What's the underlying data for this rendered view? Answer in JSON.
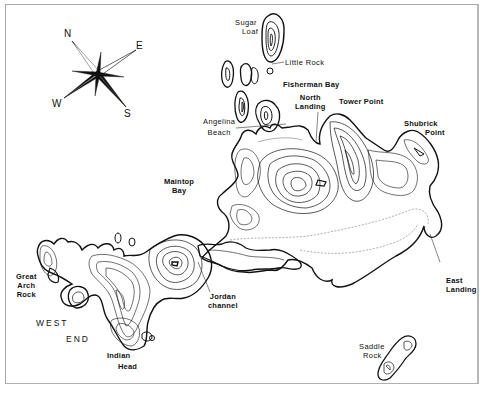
{
  "map": {
    "type": "island topographic contour map",
    "line_color": "#111111",
    "frame_color": "#a8a8a8",
    "compass": {
      "icon": "compass-rose-icon",
      "letters": {
        "north": "N",
        "east": "E",
        "south": "S",
        "west": "W"
      }
    },
    "labels": {
      "sugar_loaf": [
        "Sugar",
        "Loaf"
      ],
      "little_rock": "Little Rock",
      "fisherman_bay": "Fisherman Bay",
      "north_landing": [
        "North",
        "Landing"
      ],
      "tower_point": "Tower Point",
      "shubrick_point": [
        "Shubrick",
        "Point"
      ],
      "angelina_beach": [
        "Angelina",
        "Beach"
      ],
      "maintop_bay": [
        "Maintop",
        "Bay"
      ],
      "great_arch_rock": [
        "Great",
        "Arch",
        "Rock"
      ],
      "west_end": [
        "WEST",
        "END"
      ],
      "jordan_channel": [
        "Jordan",
        "channel"
      ],
      "indian_head": [
        "Indian",
        "Head"
      ],
      "east_landing": [
        "East",
        "Landing"
      ],
      "saddle_rock": [
        "Saddle",
        "Rock"
      ]
    }
  }
}
